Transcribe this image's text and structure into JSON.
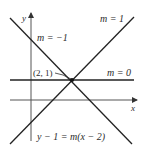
{
  "figure": {
    "type": "line-family-diagram",
    "axes": {
      "x_label": "x",
      "y_label": "y"
    },
    "point": {
      "label": "(2, 1)",
      "x": 2,
      "y": 1
    },
    "lines": [
      {
        "name": "slope-positive-one",
        "label": "m = 1",
        "slope": 1
      },
      {
        "name": "slope-negative-one",
        "label": "m = −1",
        "slope": -1
      },
      {
        "name": "slope-zero",
        "label": "m = 0",
        "slope": 0
      }
    ],
    "equation": "y − 1 = m(x − 2)",
    "colors": {
      "line": "#222222",
      "axis": "#555555",
      "text": "#2b2b2b",
      "background": "#ffffff"
    }
  }
}
